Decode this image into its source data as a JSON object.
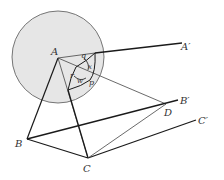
{
  "diagram": {
    "type": "geometry-figure",
    "colors": {
      "sphere_fill": "#e6e6e6",
      "line": "#1a1a1a",
      "thin_line": "#555555",
      "label": "#333333"
    },
    "points": {
      "A": "A",
      "A_prime": "A′",
      "B": "B",
      "B_prime": "B′",
      "C": "C",
      "C_prime": "C′",
      "D": "D"
    },
    "angles": {
      "q": "q",
      "x": "x",
      "r": "r",
      "w": "w",
      "p": "p"
    }
  }
}
